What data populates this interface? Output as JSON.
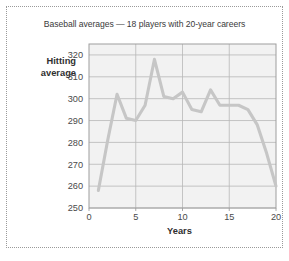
{
  "chart_data": {
    "type": "line",
    "title": "Baseball averages — 18 players with 20-year careers",
    "xlabel": "Years",
    "ylabel": "Hitting average",
    "ylabel_line1": "Hitting",
    "ylabel_line2": "average",
    "xlim": [
      0,
      20
    ],
    "ylim": [
      250,
      325
    ],
    "xticks": [
      0,
      5,
      10,
      15,
      20
    ],
    "xticklabels": [
      "0",
      "5",
      "10",
      "15",
      "20"
    ],
    "yticks": [
      250,
      260,
      270,
      280,
      290,
      300,
      310,
      320
    ],
    "yticklabels": [
      "250",
      "260",
      "270",
      "280",
      "290",
      "300",
      "310",
      "320"
    ],
    "grid": "both",
    "legend": "none",
    "series": [
      {
        "name": "Hitting average",
        "color": "#c6c6c6",
        "x": [
          1,
          2,
          3,
          4,
          5,
          6,
          7,
          8,
          9,
          10,
          11,
          12,
          13,
          14,
          15,
          16,
          17,
          18,
          19,
          20
        ],
        "values": [
          258,
          281,
          302,
          291,
          290,
          297,
          318,
          301,
          300,
          303,
          295,
          294,
          304,
          297,
          297,
          297,
          295,
          288,
          275,
          260
        ]
      }
    ]
  },
  "figure": {
    "frame_style": "dotted",
    "frame_color": "#9a9a9a",
    "background": "#ffffff",
    "plot_background": "#f2f2f2",
    "gridline_color": "#b8b8b8",
    "line_color": "#c6c6c6",
    "tick_label_color": "#4a4a4a",
    "title_color": "#3a3a3a"
  }
}
